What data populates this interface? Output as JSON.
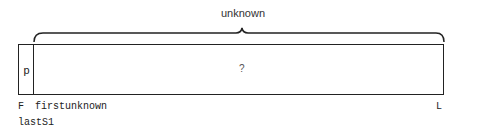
{
  "diagram": {
    "brace_label": "unknown",
    "pivot_cell_label": "p",
    "unknown_region_mark": "?",
    "index_labels": {
      "first": "F",
      "first_unknown": "firstunknown",
      "last_s1": "lastS1",
      "last": "L"
    },
    "colors": {
      "stroke": "#222222",
      "text": "#222222",
      "background": "#ffffff"
    }
  }
}
